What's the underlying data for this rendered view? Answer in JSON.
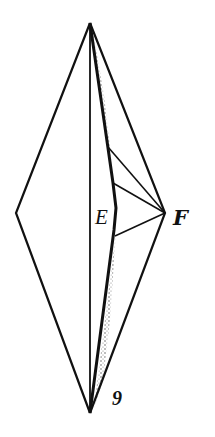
{
  "figure": {
    "type": "geometric-folding-diagram",
    "labels": {
      "e": "E",
      "f": "F",
      "figure_number": "9"
    },
    "colors": {
      "line": "#111111",
      "background": "#ffffff",
      "stipple": "#333333"
    }
  }
}
